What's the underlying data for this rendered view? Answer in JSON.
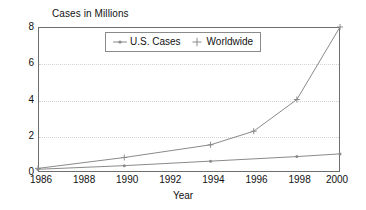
{
  "chart_data": {
    "type": "line",
    "title": "",
    "ylabel": "Cases in Millions",
    "xlabel": "Year",
    "x": [
      1986,
      1988,
      1990,
      1992,
      1994,
      1996,
      1998,
      2000
    ],
    "xtick_labels": [
      "1986",
      "1988",
      "1990",
      "1992",
      "1994",
      "1996",
      "1998",
      "2000"
    ],
    "ytick_labels": [
      "0",
      "2",
      "4",
      "6",
      "8"
    ],
    "ytick_values": [
      0,
      2,
      4,
      6,
      8
    ],
    "xlim": [
      1986,
      2000
    ],
    "ylim": [
      0,
      8
    ],
    "grid": "horizontal-dotted",
    "legend_position": "top-center-inside",
    "series": [
      {
        "name": "U.S. Cases",
        "marker": "dot",
        "color": "#8a8a8a",
        "x": [
          1986,
          1990,
          1994,
          1998,
          2000
        ],
        "values": [
          0.15,
          0.35,
          0.6,
          0.85,
          1.0
        ]
      },
      {
        "name": "Worldwide",
        "marker": "plus",
        "color": "#8a8a8a",
        "x": [
          1986,
          1990,
          1994,
          1996,
          1998,
          2000
        ],
        "values": [
          0.2,
          0.8,
          1.5,
          2.25,
          4.0,
          8.0
        ]
      }
    ]
  },
  "axes": {
    "y_title": "Cases in Millions",
    "x_title": "Year"
  },
  "legend": {
    "items": [
      {
        "label": "U.S. Cases",
        "marker": "dot-line-marker"
      },
      {
        "label": "Worldwide",
        "marker": "plus-marker"
      }
    ]
  },
  "colors": {
    "frame": "#6e6e6e",
    "grid": "#d2d2d2",
    "series_line": "#8a8a8a",
    "text": "#111111",
    "background": "#ffffff"
  }
}
